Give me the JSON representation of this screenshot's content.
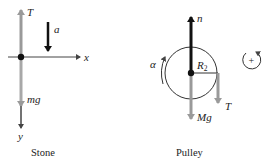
{
  "diagram": {
    "panels": [
      {
        "id": "stone",
        "caption": "Stone",
        "labels": {
          "tension": "T",
          "acceleration": "a",
          "x_axis": "x",
          "y_axis": "y",
          "weight": "mg"
        }
      },
      {
        "id": "pulley",
        "caption": "Pulley",
        "labels": {
          "normal": "n",
          "radius": "R",
          "radius_sub": "2",
          "tension": "T",
          "weight": "Mg",
          "angular_acceleration": "α",
          "positive_sense": "+"
        }
      }
    ],
    "colors": {
      "dark_arrow": "#111111",
      "gray_arrow": "#9a9a9a",
      "axis": "#444444",
      "circle": "#333333"
    }
  }
}
